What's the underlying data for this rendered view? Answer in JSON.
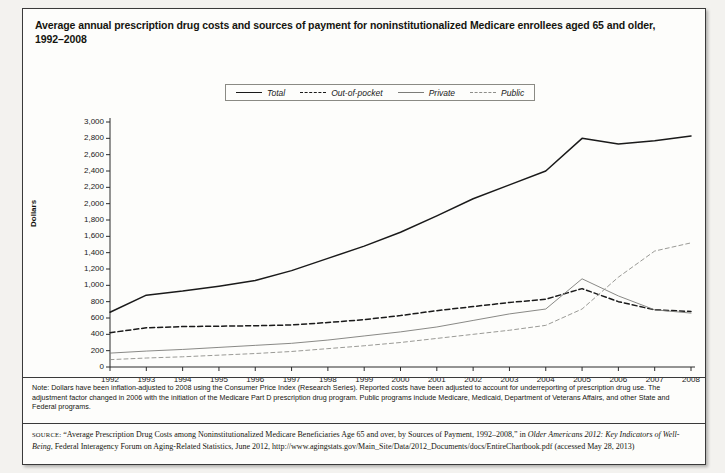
{
  "title": "Average annual prescription drug costs and sources of payment for noninstitutionalized Medicare enrollees aged 65 and older, 1992–2008",
  "legend": [
    {
      "label": "Total",
      "key": "lg-total",
      "name": "legend-key-total"
    },
    {
      "label": "Out-of-pocket",
      "key": "lg-oop",
      "name": "legend-key-out-of-pocket"
    },
    {
      "label": "Private",
      "key": "lg-priv",
      "name": "legend-key-private"
    },
    {
      "label": "Public",
      "key": "lg-pub",
      "name": "legend-key-public"
    }
  ],
  "note": {
    "text": "Note: Dollars have been inflation-adjusted to 2008 using the Consumer Price Index (Research Series). Reported costs have been adjusted to account for underreporting of prescription drug use. The adjustment factor changed in 2006 with the initiation of the Medicare Part D prescription drug program. Public programs include Medicare, Medicaid, Department of Veterans Affairs, and other State and Federal programs."
  },
  "source": {
    "label": "SOURCE:",
    "part1": " “Average Prescription Drug Costs among Noninstitutionalized Medicare Beneficiaries Age 65 and over, by Sources of Payment, 1992–2008,” in ",
    "italic": "Older Americans 2012: Key Indicators of Well-Being",
    "part2": ", Federal Interagency Forum on Aging-Related Statistics, June 2012, http://www.agingstats.gov/Main_Site/Data/2012_Documents/docs/EntireChartbook.pdf (accessed May 28, 2013)"
  },
  "chart_data": {
    "type": "line",
    "title": "Average annual prescription drug costs and sources of payment for noninstitutionalized Medicare enrollees aged 65 and older, 1992–2008",
    "xlabel": "",
    "ylabel": "Dollars",
    "ylim": [
      0,
      3000
    ],
    "ytick_step": 200,
    "grid": false,
    "legend_position": "top-center",
    "ytick_labels": [
      "0",
      "200",
      "400",
      "600",
      "800",
      "1,000",
      "1,200",
      "1,400",
      "1,600",
      "1,800",
      "2,000",
      "2,200",
      "2,400",
      "2,600",
      "2,800",
      "3,000"
    ],
    "x": [
      1992,
      1993,
      1994,
      1995,
      1996,
      1997,
      1998,
      1999,
      2000,
      2001,
      2002,
      2003,
      2004,
      2005,
      2006,
      2007,
      2008
    ],
    "xtick_labels": [
      "1992",
      "1993",
      "1994",
      "1995",
      "1996",
      "1997",
      "1998",
      "1999",
      "2000",
      "2001",
      "2002",
      "2003",
      "2004",
      "2005",
      "2006",
      "2007",
      "2008"
    ],
    "series": [
      {
        "name": "Total",
        "style": "solid-thick",
        "color": "#1a1a1a",
        "values": [
          670,
          880,
          930,
          990,
          1060,
          1180,
          1330,
          1480,
          1650,
          1850,
          2060,
          2230,
          2400,
          2800,
          2730,
          2770,
          2830
        ]
      },
      {
        "name": "Out-of-pocket",
        "style": "dashed-thick",
        "color": "#1a1a1a",
        "values": [
          420,
          480,
          495,
          500,
          505,
          515,
          545,
          580,
          630,
          690,
          740,
          790,
          830,
          960,
          800,
          700,
          680
        ]
      },
      {
        "name": "Private",
        "style": "solid-thin",
        "color": "#7c7c78",
        "values": [
          170,
          195,
          215,
          240,
          265,
          290,
          330,
          380,
          430,
          490,
          570,
          650,
          710,
          1080,
          870,
          700,
          660
        ]
      },
      {
        "name": "Public",
        "style": "dashed-thin",
        "color": "#8e8e8a",
        "values": [
          90,
          110,
          125,
          145,
          165,
          190,
          225,
          260,
          300,
          350,
          400,
          450,
          510,
          710,
          1100,
          1420,
          1520
        ]
      }
    ]
  }
}
